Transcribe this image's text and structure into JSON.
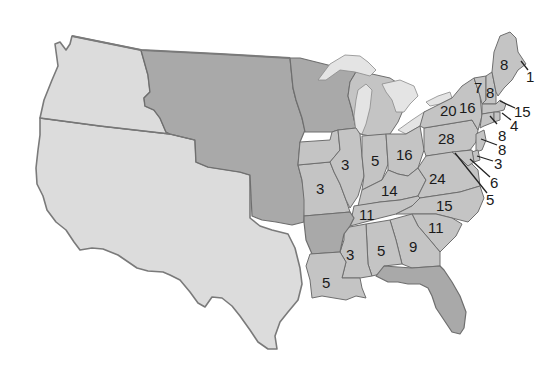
{
  "map": {
    "colors": {
      "background": "#ffffff",
      "territory_light": "#dcdcdc",
      "territory_dark": "#a9a9a9",
      "state_fill": "#c4c4c4",
      "border": "#6e6e6e",
      "label": "#1a1a1a"
    },
    "regions": {
      "oregon_country": "light",
      "mexican_territory": "light",
      "unorganized_territory": "dark",
      "wisconsin_territory": "dark",
      "iowa_territory": "dark",
      "florida_territory": "dark",
      "arkansas": "dark"
    },
    "state_labels": [
      {
        "state": "Maine",
        "votes": "8",
        "x": 505,
        "y": 65
      },
      {
        "state": "Vermont",
        "votes": "7",
        "x": 478,
        "y": 88
      },
      {
        "state": "New Hampshire",
        "votes": "8",
        "x": 491,
        "y": 94
      },
      {
        "state": "New York",
        "votes": "16",
        "x": 468,
        "y": 109
      },
      {
        "state": "New York West",
        "votes": "20",
        "x": 440,
        "y": 115
      },
      {
        "state": "Pennsylvania",
        "votes": "28",
        "x": 446,
        "y": 140
      },
      {
        "state": "Ohio",
        "votes": "16",
        "x": 404,
        "y": 157
      },
      {
        "state": "Indiana",
        "votes": "5",
        "x": 375,
        "y": 163
      },
      {
        "state": "Illinois",
        "votes": "3",
        "x": 345,
        "y": 167
      },
      {
        "state": "Missouri",
        "votes": "3",
        "x": 320,
        "y": 191
      },
      {
        "state": "Kentucky",
        "votes": "14",
        "x": 390,
        "y": 193
      },
      {
        "state": "Virginia",
        "votes": "24",
        "x": 436,
        "y": 180
      },
      {
        "state": "Tennessee",
        "votes": "11",
        "x": 367,
        "y": 217
      },
      {
        "state": "North Carolina",
        "votes": "15",
        "x": 444,
        "y": 208
      },
      {
        "state": "South Carolina",
        "votes": "11",
        "x": 436,
        "y": 230
      },
      {
        "state": "Georgia",
        "votes": "9",
        "x": 413,
        "y": 250
      },
      {
        "state": "Alabama",
        "votes": "5",
        "x": 381,
        "y": 254
      },
      {
        "state": "Mississippi",
        "votes": "3",
        "x": 350,
        "y": 258
      },
      {
        "state": "Louisiana",
        "votes": "5",
        "x": 326,
        "y": 286
      }
    ],
    "callout_labels": [
      {
        "state": "Maine coast",
        "votes": "1",
        "x": 530,
        "y": 79,
        "x1": 521,
        "y1": 61,
        "x2": 528,
        "y2": 70
      },
      {
        "state": "Massachusetts",
        "votes": "15",
        "x": 520,
        "y": 115,
        "x1": 500,
        "y1": 101,
        "x2": 515,
        "y2": 108
      },
      {
        "state": "Rhode Island",
        "votes": "4",
        "x": 514,
        "y": 129,
        "x1": 502,
        "y1": 113,
        "x2": 511,
        "y2": 120
      },
      {
        "state": "Connecticut",
        "votes": "8",
        "x": 502,
        "y": 138,
        "x1": 490,
        "y1": 116,
        "x2": 497,
        "y2": 124
      },
      {
        "state": "New Jersey",
        "votes": "8",
        "x": 504,
        "y": 154,
        "x1": 481,
        "y1": 139,
        "x2": 497,
        "y2": 145
      },
      {
        "state": "Delaware",
        "votes": "3",
        "x": 500,
        "y": 170,
        "x1": 477,
        "y1": 156,
        "x2": 493,
        "y2": 161
      },
      {
        "state": "Maryland",
        "votes": "6",
        "x": 496,
        "y": 186,
        "x1": 470,
        "y1": 159,
        "x2": 490,
        "y2": 177
      },
      {
        "state": "Maryland west",
        "votes": "5",
        "x": 492,
        "y": 205,
        "x1": 455,
        "y1": 153,
        "x2": 487,
        "y2": 193
      }
    ]
  }
}
